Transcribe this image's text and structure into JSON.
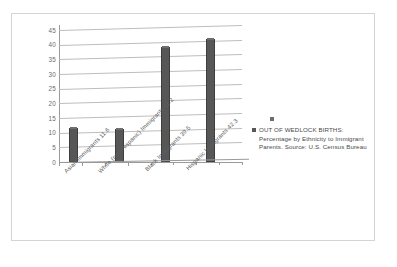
{
  "chart_data": {
    "type": "bar",
    "title": "",
    "xlabel": "",
    "ylabel": "",
    "ylim": [
      0,
      45
    ],
    "grid": true,
    "legend_position": "right",
    "categories": [
      "Asian Immigrants 11.6",
      "White (non-Hispanic) Immigrants 11.2",
      "Black Immigrants 39.5",
      "Hispanic Immigrants 42.3"
    ],
    "values": [
      11.6,
      11.2,
      39.5,
      42.3
    ],
    "series": [
      {
        "name": "OUT OF WEDLOCK BIRTHS: Percentage by Ethnicity to Immigrant Parents.  Source:  U.S. Census Bureau",
        "values": [
          11.6,
          11.2,
          39.5,
          42.3
        ]
      }
    ],
    "y_ticks": [
      "0",
      "5",
      "10",
      "15",
      "20",
      "25",
      "30",
      "35",
      "40",
      "45"
    ],
    "bar_color": "#575757",
    "grid_color": "#bdbdbd",
    "axis_color": "#9a9a9a"
  },
  "legend": {
    "label": "OUT OF WEDLOCK BIRTHS: Percentage by Ethnicity to Immigrant Parents.  Source:  U.S. Census Bureau",
    "swatch_color": "#575757"
  },
  "frame": {
    "border_color": "#d4d4d4",
    "background": "#ffffff"
  }
}
